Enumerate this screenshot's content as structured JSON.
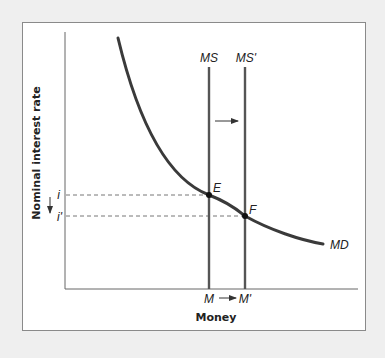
{
  "diagram": {
    "y_axis_label": "Nominal interest rate",
    "x_axis_label": "Money",
    "curves": {
      "money_demand": "MD",
      "money_supply_initial": "MS",
      "money_supply_new": "MS'"
    },
    "points": {
      "initial_equilibrium": "E",
      "new_equilibrium": "F"
    },
    "interest_rates": {
      "initial": "i",
      "new": "i'"
    },
    "money_quantities": {
      "initial": "M",
      "new": "M'"
    },
    "shift_direction": "right",
    "rate_change_direction": "down",
    "colors": {
      "curve": "#3a3a3a",
      "axis": "#555555",
      "frame_border": "#8a8a8a",
      "background": "#efefef",
      "panel": "#ffffff"
    }
  }
}
